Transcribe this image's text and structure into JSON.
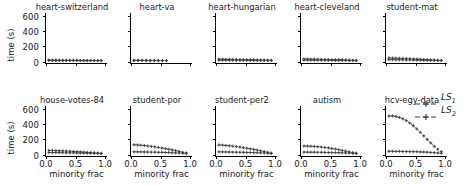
{
  "figure": {
    "axis_label_y": "time (s)",
    "axis_label_x": "minority frac",
    "y_ticks": [
      "0",
      "200",
      "400",
      "600"
    ],
    "x_ticks": [
      "0.0",
      "0.5",
      "1.0"
    ],
    "line_color": "#3a3a3a",
    "marker_color": "#3a3a3a",
    "background": "#ffffff"
  },
  "legend": {
    "entries": [
      {
        "name": "LS",
        "sub": "1",
        "marker": "plus-marker",
        "style": "dashed"
      },
      {
        "name": "LS",
        "sub": "2",
        "marker": "plus-marker",
        "style": "dashed"
      }
    ]
  },
  "chart_data": {
    "type": "line",
    "title": "",
    "xlabel": "minority frac",
    "ylabel": "time (s)",
    "xlim": [
      0.0,
      1.05
    ],
    "ylim": [
      -30,
      640
    ],
    "xticks": [
      0.0,
      0.5,
      1.0
    ],
    "yticks": [
      0,
      200,
      400,
      600
    ],
    "grid": false,
    "legend_position": "right",
    "layout": {
      "rows": 2,
      "cols": 5
    },
    "panels": [
      {
        "title": "heart-switzerland",
        "row": 0,
        "col": 0,
        "x": [
          0.05,
          0.11,
          0.17,
          0.23,
          0.29,
          0.35,
          0.41,
          0.47,
          0.53,
          0.59,
          0.65,
          0.71,
          0.77,
          0.83,
          0.89,
          0.95
        ],
        "series": [
          {
            "name": "LS1",
            "values": [
              9,
              8,
              8,
              7,
              7,
              7,
              6,
              6,
              6,
              5,
              5,
              5,
              4,
              4,
              4,
              3
            ]
          },
          {
            "name": "LS2",
            "values": [
              4,
              4,
              4,
              3,
              3,
              3,
              3,
              3,
              3,
              2,
              2,
              2,
              2,
              2,
              2,
              2
            ]
          }
        ]
      },
      {
        "title": "heart-va",
        "row": 0,
        "col": 1,
        "x": [
          0.05,
          0.12,
          0.19,
          0.26,
          0.33,
          0.4,
          0.47,
          0.54,
          0.61
        ],
        "series": [
          {
            "name": "LS1",
            "values": [
              7,
              7,
              6,
              6,
              5,
              5,
              4,
              4,
              3
            ]
          },
          {
            "name": "LS2",
            "values": [
              3,
              3,
              3,
              3,
              2,
              2,
              2,
              2,
              2
            ]
          }
        ]
      },
      {
        "title": "heart-hungarian",
        "row": 0,
        "col": 2,
        "x": [
          0.05,
          0.11,
          0.17,
          0.23,
          0.29,
          0.35,
          0.41,
          0.47,
          0.53,
          0.59,
          0.65,
          0.71,
          0.77,
          0.83,
          0.89,
          0.95
        ],
        "series": [
          {
            "name": "LS1",
            "values": [
              22,
              21,
              20,
              19,
              18,
              17,
              16,
              15,
              14,
              13,
              12,
              11,
              10,
              9,
              8,
              6
            ]
          },
          {
            "name": "LS2",
            "values": [
              8,
              8,
              7,
              7,
              7,
              6,
              6,
              6,
              5,
              5,
              5,
              4,
              4,
              4,
              3,
              3
            ]
          }
        ]
      },
      {
        "title": "heart-cleveland",
        "row": 0,
        "col": 3,
        "x": [
          0.05,
          0.11,
          0.17,
          0.23,
          0.29,
          0.35,
          0.41,
          0.47,
          0.53,
          0.59,
          0.65,
          0.71,
          0.77,
          0.83,
          0.89,
          0.95
        ],
        "series": [
          {
            "name": "LS1",
            "values": [
              24,
              23,
              22,
              21,
              20,
              19,
              18,
              17,
              15,
              14,
              13,
              11,
              10,
              9,
              7,
              6
            ]
          },
          {
            "name": "LS2",
            "values": [
              9,
              9,
              8,
              8,
              7,
              7,
              7,
              6,
              6,
              5,
              5,
              5,
              4,
              4,
              3,
              3
            ]
          }
        ]
      },
      {
        "title": "student-mat",
        "row": 0,
        "col": 4,
        "x": [
          0.05,
          0.11,
          0.17,
          0.23,
          0.29,
          0.35,
          0.41,
          0.47,
          0.53,
          0.59,
          0.65,
          0.71,
          0.77,
          0.83,
          0.89,
          0.95
        ],
        "series": [
          {
            "name": "LS1",
            "values": [
              38,
              37,
              35,
              33,
              31,
              29,
              27,
              25,
              22,
              20,
              17,
              15,
              12,
              10,
              7,
              5
            ]
          },
          {
            "name": "LS2",
            "values": [
              14,
              14,
              13,
              13,
              12,
              11,
              11,
              10,
              9,
              8,
              8,
              7,
              6,
              5,
              4,
              3
            ]
          }
        ]
      },
      {
        "title": "house-votes-84",
        "row": 1,
        "col": 0,
        "x": [
          0.05,
          0.11,
          0.17,
          0.23,
          0.29,
          0.35,
          0.41,
          0.47,
          0.53,
          0.59,
          0.65,
          0.71,
          0.77,
          0.83,
          0.89,
          0.95
        ],
        "series": [
          {
            "name": "LS1",
            "values": [
              45,
              44,
              42,
              40,
              38,
              36,
              34,
              31,
              28,
              25,
              22,
              19,
              16,
              12,
              9,
              5
            ]
          },
          {
            "name": "LS2",
            "values": [
              16,
              16,
              15,
              15,
              14,
              13,
              12,
              12,
              11,
              10,
              9,
              8,
              7,
              6,
              5,
              4
            ]
          }
        ]
      },
      {
        "title": "student-por",
        "row": 1,
        "col": 1,
        "x": [
          0.05,
          0.11,
          0.17,
          0.23,
          0.29,
          0.35,
          0.41,
          0.47,
          0.53,
          0.59,
          0.65,
          0.71,
          0.77,
          0.83,
          0.89,
          0.95
        ],
        "series": [
          {
            "name": "LS1",
            "values": [
              120,
              118,
              114,
              110,
              104,
              98,
              92,
              85,
              77,
              69,
              60,
              51,
              41,
              31,
              20,
              9
            ]
          },
          {
            "name": "LS2",
            "values": [
              26,
              26,
              25,
              24,
              23,
              22,
              21,
              20,
              19,
              17,
              16,
              14,
              12,
              10,
              8,
              5
            ]
          }
        ]
      },
      {
        "title": "student-per2",
        "row": 1,
        "col": 2,
        "x": [
          0.05,
          0.11,
          0.17,
          0.23,
          0.29,
          0.35,
          0.41,
          0.47,
          0.53,
          0.59,
          0.65,
          0.71,
          0.77,
          0.83,
          0.89,
          0.95
        ],
        "series": [
          {
            "name": "LS1",
            "values": [
              118,
              116,
              112,
              107,
              102,
              96,
              89,
              82,
              74,
              66,
              58,
              49,
              39,
              29,
              19,
              8
            ]
          },
          {
            "name": "LS2",
            "values": [
              25,
              25,
              24,
              23,
              22,
              21,
              20,
              19,
              18,
              17,
              15,
              13,
              12,
              10,
              7,
              5
            ]
          }
        ]
      },
      {
        "title": "autism",
        "row": 1,
        "col": 3,
        "x": [
          0.05,
          0.11,
          0.17,
          0.23,
          0.29,
          0.35,
          0.41,
          0.47,
          0.53,
          0.59,
          0.65,
          0.71,
          0.77,
          0.83,
          0.89,
          0.95
        ],
        "series": [
          {
            "name": "LS1",
            "values": [
              104,
              103,
              101,
              98,
              94,
              89,
              84,
              78,
              71,
              63,
              54,
              45,
              35,
              25,
              15,
              7
            ]
          },
          {
            "name": "LS2",
            "values": [
              22,
              22,
              21,
              21,
              20,
              19,
              18,
              17,
              16,
              15,
              13,
              12,
              10,
              9,
              7,
              5
            ]
          }
        ]
      },
      {
        "title": "hcv-egy-data",
        "row": 1,
        "col": 4,
        "x": [
          0.05,
          0.11,
          0.17,
          0.23,
          0.29,
          0.35,
          0.41,
          0.47,
          0.53,
          0.59,
          0.65,
          0.71,
          0.77,
          0.83,
          0.89,
          0.95
        ],
        "series": [
          {
            "name": "LS1",
            "values": [
              505,
              508,
              500,
              487,
              468,
              443,
              412,
              375,
              333,
              288,
              240,
              192,
              145,
              101,
              62,
              28
            ]
          },
          {
            "name": "LS2",
            "values": [
              33,
              33,
              32,
              32,
              31,
              30,
              29,
              28,
              27,
              25,
              23,
              21,
              18,
              15,
              11,
              7
            ]
          }
        ]
      }
    ]
  }
}
